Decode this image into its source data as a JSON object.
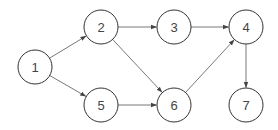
{
  "diagram": {
    "type": "directed-graph",
    "colors": {
      "node_stroke": "#333333",
      "node_fill": "#ffffff",
      "edge": "#555555",
      "label": "#444444",
      "background": "#ffffff"
    },
    "node_radius": 17,
    "nodes": [
      {
        "id": "1",
        "label": "1",
        "x": 35,
        "y": 67
      },
      {
        "id": "2",
        "label": "2",
        "x": 101,
        "y": 27
      },
      {
        "id": "3",
        "label": "3",
        "x": 174,
        "y": 27
      },
      {
        "id": "4",
        "label": "4",
        "x": 246,
        "y": 27
      },
      {
        "id": "5",
        "label": "5",
        "x": 101,
        "y": 105
      },
      {
        "id": "6",
        "label": "6",
        "x": 174,
        "y": 105
      },
      {
        "id": "7",
        "label": "7",
        "x": 246,
        "y": 105
      }
    ],
    "edges": [
      {
        "from": "1",
        "to": "2"
      },
      {
        "from": "1",
        "to": "5"
      },
      {
        "from": "2",
        "to": "3"
      },
      {
        "from": "2",
        "to": "6"
      },
      {
        "from": "3",
        "to": "4"
      },
      {
        "from": "5",
        "to": "6"
      },
      {
        "from": "6",
        "to": "4"
      },
      {
        "from": "4",
        "to": "7"
      }
    ]
  }
}
